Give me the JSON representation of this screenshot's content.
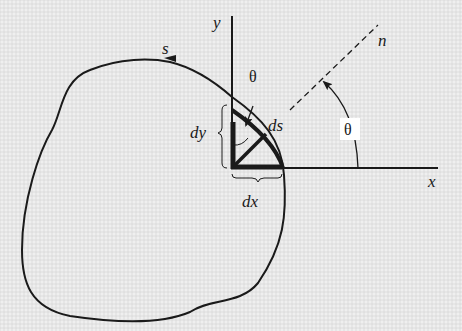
{
  "diagram": {
    "labels": {
      "y_axis": "y",
      "x_axis": "x",
      "arc_length": "s",
      "normal": "n",
      "ds": "ds",
      "dx": "dx",
      "dy": "dy",
      "theta_small": "θ",
      "theta_large": "θ"
    },
    "colors": {
      "background": "#e6e6e6",
      "ink": "#1a1a1a",
      "label_box": "#ffffff"
    }
  }
}
